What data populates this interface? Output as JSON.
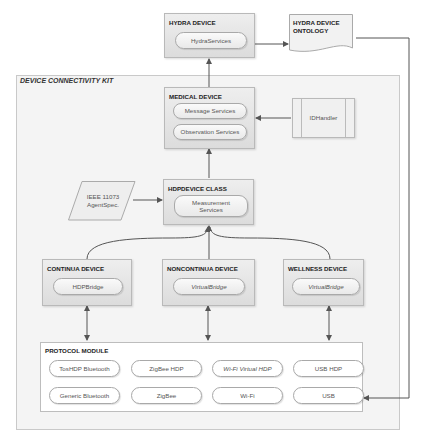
{
  "kit": {
    "title": "DEVICE CONNECTIVITY KIT"
  },
  "hydra_device": {
    "title": "HYDRA DEVICE",
    "services": [
      "HydraServices"
    ]
  },
  "ontology": {
    "title_line1": "HYDRA DEVICE",
    "title_line2": "ONTOLOGY"
  },
  "medical_device": {
    "title": "MEDICAL DEVICE",
    "services": [
      "Message Services",
      "Observation Services"
    ]
  },
  "idhandler": {
    "label": "IDHandler"
  },
  "ieee_spec": {
    "line1": "IEEE 11073",
    "line2": "AgentSpec."
  },
  "hdp_device_class": {
    "title": "HDPDEVICE CLASS",
    "service_line1": "Measurement",
    "service_line2": "Services"
  },
  "continua_device": {
    "title": "CONTINUA DEVICE",
    "service": "HDPBridge"
  },
  "noncontinua_device": {
    "title": "NONCONTINUA DEVICE",
    "service": "VirtualBridge"
  },
  "wellness_device": {
    "title": "WELLNESS DEVICE",
    "service": "VirtualBridge"
  },
  "protocol_module": {
    "title": "PROTOCOL MODULE",
    "row1": [
      "TosHDP Bluetooth",
      "ZigBee HDP",
      "Wi-Fi Virtual HDP",
      "USB HDP"
    ],
    "row2": [
      "Generic Bluetooth",
      "ZigBee",
      "Wi-Fi",
      "USB"
    ]
  }
}
